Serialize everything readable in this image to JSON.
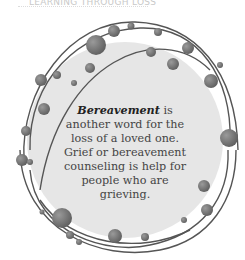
{
  "header": {
    "label": "ﾠ",
    "title": "LEARNING THROUGH LOSS"
  },
  "callout": {
    "term": "Bereavement",
    "text": " is another word for the loss of a loved one. Grief or bereavement counseling is help for people who are grieving."
  },
  "colors": {
    "circle_fill": "#e6e6e6",
    "ring_stroke": "#555555",
    "dot_fill": "#7a7a7a",
    "text": "#444444"
  }
}
